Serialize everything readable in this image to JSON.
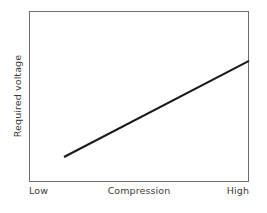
{
  "chart_data": {
    "type": "line",
    "title": "",
    "xlabel": "Compression",
    "ylabel": "Required voltage",
    "x_tick_labels": [
      "Low",
      "High"
    ],
    "y_tick_labels": [],
    "xlim": [
      0,
      1
    ],
    "ylim": [
      0,
      1
    ],
    "grid": false,
    "legend": null,
    "annotations": [],
    "series": [
      {
        "name": "Required voltage vs compression",
        "style": "solid-straight-line",
        "color": "#1a1a1a",
        "line_width_px": 2,
        "x": [
          0.159,
          1.0
        ],
        "y": [
          0.146,
          0.708
        ],
        "description": "Monotonically increasing straight line; required voltage rises steadily as compression increases from low to high."
      }
    ],
    "frame": {
      "color": "#6e6e6e",
      "line_width_px": 1,
      "left_px": 29,
      "top_px": 11,
      "right_px": 249,
      "bottom_px": 182
    }
  },
  "axes": {
    "x": {
      "title": "Compression",
      "low_label": "Low",
      "high_label": "High"
    },
    "y": {
      "title": "Required voltage"
    }
  },
  "colors": {
    "background": "#ffffff",
    "frame": "#6e6e6e",
    "data_line": "#1a1a1a",
    "text": "#3b3b3b"
  }
}
